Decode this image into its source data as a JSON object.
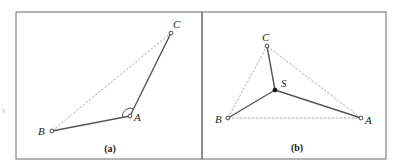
{
  "figure": {
    "panels": [
      {
        "id": "a",
        "caption": "(a)",
        "frame": {
          "x": 16,
          "y": 12,
          "w": 186,
          "h": 147
        },
        "points": [
          {
            "label": "A",
            "x": 130,
            "y": 116,
            "style": "open",
            "label_x": 134,
            "label_y": 121
          },
          {
            "label": "B",
            "x": 52,
            "y": 131,
            "style": "open",
            "label_x": 38,
            "label_y": 135
          },
          {
            "label": "C",
            "x": 171,
            "y": 33,
            "style": "open",
            "label_x": 173,
            "label_y": 28
          }
        ],
        "solid_edges": [
          [
            "B",
            "A"
          ],
          [
            "A",
            "C"
          ]
        ],
        "dashed_edges": [
          [
            "B",
            "C"
          ]
        ],
        "angle_marker_at": "A"
      },
      {
        "id": "b",
        "caption": "(b)",
        "frame": {
          "x": 202,
          "y": 12,
          "w": 184,
          "h": 147
        },
        "points": [
          {
            "label": "A",
            "x": 361,
            "y": 118,
            "style": "open",
            "label_x": 365,
            "label_y": 124
          },
          {
            "label": "B",
            "x": 228,
            "y": 118,
            "style": "open",
            "label_x": 215,
            "label_y": 123
          },
          {
            "label": "C",
            "x": 267,
            "y": 46,
            "style": "open",
            "label_x": 262,
            "label_y": 41
          },
          {
            "label": "S",
            "x": 275,
            "y": 90,
            "style": "filled",
            "label_x": 281,
            "label_y": 87
          }
        ],
        "solid_edges": [
          [
            "C",
            "S"
          ],
          [
            "B",
            "S"
          ],
          [
            "S",
            "A"
          ]
        ],
        "dashed_edges": [
          [
            "B",
            "C"
          ],
          [
            "C",
            "A"
          ],
          [
            "B",
            "A"
          ]
        ]
      }
    ],
    "edge_fragment": "s"
  }
}
